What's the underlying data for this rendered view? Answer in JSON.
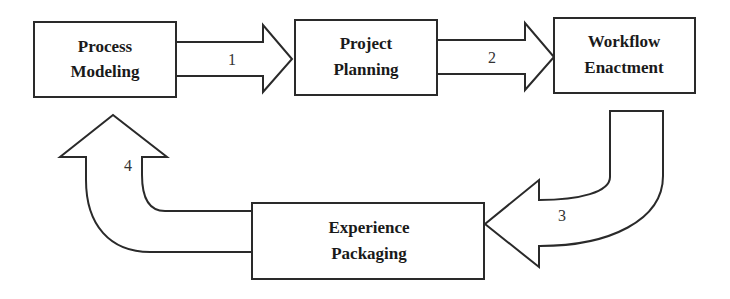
{
  "diagram": {
    "type": "cyclic-process-flow",
    "nodes": [
      {
        "id": "process-modeling",
        "line1": "Process",
        "line2": "Modeling"
      },
      {
        "id": "project-planning",
        "line1": "Project",
        "line2": "Planning"
      },
      {
        "id": "workflow-enactment",
        "line1": "Workflow",
        "line2": "Enactment"
      },
      {
        "id": "experience-packaging",
        "line1": "Experience",
        "line2": "Packaging"
      }
    ],
    "edges": [
      {
        "from": "process-modeling",
        "to": "project-planning",
        "label": "1"
      },
      {
        "from": "project-planning",
        "to": "workflow-enactment",
        "label": "2"
      },
      {
        "from": "workflow-enactment",
        "to": "experience-packaging",
        "label": "3"
      },
      {
        "from": "experience-packaging",
        "to": "process-modeling",
        "label": "4"
      }
    ],
    "colors": {
      "stroke": "#2a2a2a",
      "fill": "#ffffff",
      "text": "#1a1a1a"
    }
  }
}
